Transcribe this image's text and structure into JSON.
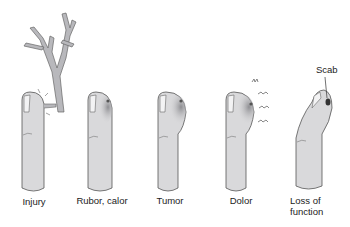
{
  "figure": {
    "panels": [
      {
        "id": "injury",
        "label": "Injury"
      },
      {
        "id": "rubor-calor",
        "label": "Rubor, calor"
      },
      {
        "id": "tumor",
        "label": "Tumor"
      },
      {
        "id": "dolor",
        "label": "Dolor"
      },
      {
        "id": "loss-of-function",
        "label_line1": "Loss of",
        "label_line2": "function"
      }
    ],
    "annotation": "Scab",
    "colors": {
      "skin": "#d9d9db",
      "outline": "#555555",
      "inflamed": "#9a9a9e",
      "branch": "#b8b8bc"
    }
  }
}
